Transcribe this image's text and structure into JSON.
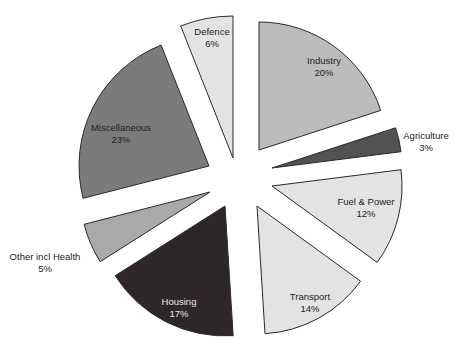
{
  "chart_data": {
    "type": "pie",
    "title": "",
    "exploded": true,
    "start_angle_deg": 0,
    "direction": "clockwise",
    "slices": [
      {
        "label": "Industry",
        "value": 20,
        "pct_label": "20%",
        "color": "#bcbcbc",
        "text_color": "#222222",
        "tip": [
          259,
          150
        ],
        "r": 128,
        "label_pos": [
          324,
          64
        ]
      },
      {
        "label": "Agriculture",
        "value": 3,
        "pct_label": "3%",
        "color": "#545152",
        "text_color": "#222222",
        "tip": [
          272,
          168
        ],
        "r": 130,
        "label_pos": [
          426,
          139
        ],
        "label_outside": true
      },
      {
        "label": "Fuel & Power",
        "value": 12,
        "pct_label": "12%",
        "color": "#e3e3e3",
        "text_color": "#222222",
        "tip": [
          272,
          186
        ],
        "r": 130,
        "label_pos": [
          366,
          205
        ]
      },
      {
        "label": "Transport",
        "value": 14,
        "pct_label": "14%",
        "color": "#e3e3e3",
        "text_color": "#222222",
        "tip": [
          257,
          206
        ],
        "r": 128,
        "label_pos": [
          310,
          300
        ]
      },
      {
        "label": "Housing",
        "value": 17,
        "pct_label": "17%",
        "color": "#2e2729",
        "text_color": "#e8e8e8",
        "tip": [
          225,
          206
        ],
        "r": 130,
        "label_pos": [
          179,
          305
        ]
      },
      {
        "label": "Other incl Health",
        "value": 5,
        "pct_label": "5%",
        "color": "#a9a9a9",
        "text_color": "#222222",
        "tip": [
          210,
          192
        ],
        "r": 130,
        "label_pos": [
          45,
          260
        ],
        "label_outside": true
      },
      {
        "label": "Miscellaneous",
        "value": 23,
        "pct_label": "23%",
        "color": "#7b7b7b",
        "text_color": "#222222",
        "tip": [
          209,
          166
        ],
        "r": 130,
        "label_pos": [
          121,
          131
        ]
      },
      {
        "label": "Defence",
        "value": 6,
        "pct_label": "6%",
        "color": "#e3e3e3",
        "text_color": "#222222",
        "tip": [
          233,
          158
        ],
        "r": 142,
        "label_pos": [
          212,
          35
        ]
      }
    ]
  }
}
